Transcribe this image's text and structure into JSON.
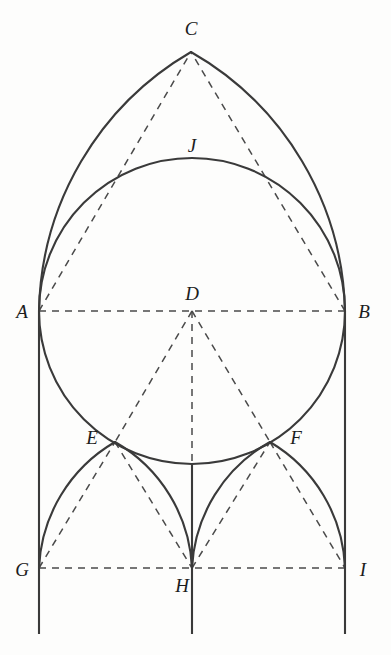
{
  "figure": {
    "canvas": {
      "width": 391,
      "height": 655
    },
    "stroke_colors": {
      "solid": "#3a3a3a",
      "dashed": "#4a4a4a",
      "label": "#1c1c1c",
      "background": "#fdfdfc"
    }
  },
  "points": [
    {
      "id": "A",
      "label": "A",
      "x": 39,
      "y": 311,
      "label_x": 22,
      "label_y": 318
    },
    {
      "id": "B",
      "label": "B",
      "x": 345,
      "y": 311,
      "label_x": 364,
      "label_y": 318
    },
    {
      "id": "C",
      "label": "C",
      "x": 191,
      "y": 52,
      "label_x": 191,
      "label_y": 35
    },
    {
      "id": "D",
      "label": "D",
      "x": 192,
      "y": 311,
      "label_x": 192,
      "label_y": 300
    },
    {
      "id": "E",
      "label": "E",
      "x": 115,
      "y": 442,
      "label_x": 92,
      "label_y": 444
    },
    {
      "id": "F",
      "label": "F",
      "x": 270,
      "y": 442,
      "label_x": 296,
      "label_y": 444
    },
    {
      "id": "G",
      "label": "G",
      "x": 39,
      "y": 568,
      "label_x": 22,
      "label_y": 576
    },
    {
      "id": "H",
      "label": "H",
      "x": 192,
      "y": 568,
      "label_x": 182,
      "label_y": 592
    },
    {
      "id": "I",
      "label": "I",
      "x": 345,
      "y": 568,
      "label_x": 363,
      "label_y": 576
    },
    {
      "id": "J",
      "label": "J",
      "x": 192,
      "y": 158,
      "label_x": 192,
      "label_y": 152
    }
  ],
  "solid_paths": [
    {
      "name": "arc-A-to-C",
      "d": "M 39 311 A 306 306 0 0 1 191 52"
    },
    {
      "name": "arc-B-to-C",
      "d": "M 345 311 A 306 306 0 0 0 191 52"
    },
    {
      "name": "circle-inscribed",
      "d": "M 39 311 A 153 153 0 1 1 345 311 A 153 153 0 1 1 39 311"
    },
    {
      "name": "arc-G-to-E",
      "d": "M 39 568 A 153 153 0 0 1 115 442"
    },
    {
      "name": "arc-H-to-E",
      "d": "M 192 568 A 153 153 0 0 0 115 442"
    },
    {
      "name": "arc-H-to-F",
      "d": "M 192 568 A 153 153 0 0 1 270 442"
    },
    {
      "name": "arc-I-to-F",
      "d": "M 345 568 A 153 153 0 0 0 270 442"
    },
    {
      "name": "pier-left",
      "d": "M 39 311 L 39 634"
    },
    {
      "name": "pier-center",
      "d": "M 192 464 L 192 634"
    },
    {
      "name": "pier-right",
      "d": "M 345 311 L 345 634"
    }
  ],
  "dashed_paths": [
    {
      "name": "chord-A-to-B",
      "d": "M 39 311 L 345 311"
    },
    {
      "name": "chord-G-to-I",
      "d": "M 39 568 L 345 568"
    },
    {
      "name": "chord-A-to-C",
      "d": "M 39 311 L 191 52"
    },
    {
      "name": "chord-B-to-C",
      "d": "M 345 311 L 191 52"
    },
    {
      "name": "radius-D-to-E",
      "d": "M 192 311 L 115 442"
    },
    {
      "name": "radius-D-to-F",
      "d": "M 192 311 L 270 442"
    },
    {
      "name": "radius-D-to-H",
      "d": "M 192 311 L 192 568"
    },
    {
      "name": "chord-G-to-E",
      "d": "M 39 568 L 115 442"
    },
    {
      "name": "chord-E-to-H",
      "d": "M 115 442 L 192 568"
    },
    {
      "name": "chord-H-to-F",
      "d": "M 192 568 L 270 442"
    },
    {
      "name": "chord-F-to-I",
      "d": "M 270 442 L 345 568"
    }
  ]
}
